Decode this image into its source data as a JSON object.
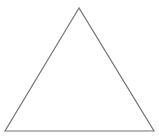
{
  "diagram": {
    "shape": "triangle",
    "type": "equilateral",
    "stroke_color": "#757575",
    "fill_color": "none",
    "background_color": "#ffffff",
    "stroke_width": 1.2,
    "vertices": {
      "apex": [
        79,
        8
      ],
      "bottom_left": [
        5,
        131
      ],
      "bottom_right": [
        154,
        131
      ]
    }
  }
}
